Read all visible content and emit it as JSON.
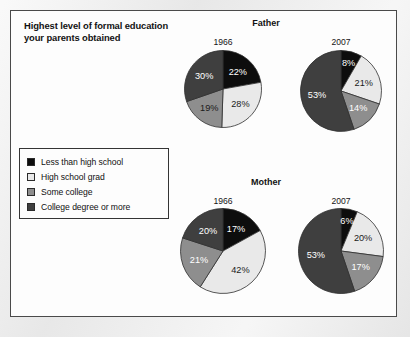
{
  "panel": {
    "title": "Highest level of formal education your parents obtained"
  },
  "groups": {
    "father": "Father",
    "mother": "Mother"
  },
  "legend": {
    "items": [
      {
        "label": "Less than high school",
        "color": "#0d0d0d"
      },
      {
        "label": "High school grad",
        "color": "#e9e9e9"
      },
      {
        "label": "Some college",
        "color": "#8e8e8e"
      },
      {
        "label": "College degree or more",
        "color": "#3f3f3f"
      }
    ]
  },
  "chart_data": {
    "type": "pie",
    "title": "Highest level of formal education your parents obtained",
    "categories": [
      "Less than high school",
      "High school grad",
      "Some college",
      "College degree or more"
    ],
    "colors": [
      "#0d0d0d",
      "#e9e9e9",
      "#8e8e8e",
      "#3f3f3f"
    ],
    "legend_position": "left",
    "units": "percent",
    "charts": [
      {
        "group": "Father",
        "year": "1966",
        "values": [
          22,
          28,
          19,
          30
        ],
        "labels": [
          "22%",
          "28%",
          "19%",
          "30%"
        ],
        "label_on_dark": [
          true,
          false,
          false,
          true
        ]
      },
      {
        "group": "Father",
        "year": "2007",
        "values": [
          8,
          21,
          14,
          53
        ],
        "labels": [
          "8%",
          "21%",
          "14%",
          "53%"
        ],
        "label_on_dark": [
          true,
          false,
          true,
          true
        ]
      },
      {
        "group": "Mother",
        "year": "1966",
        "values": [
          17,
          42,
          21,
          20
        ],
        "labels": [
          "17%",
          "42%",
          "21%",
          "20%"
        ],
        "label_on_dark": [
          true,
          false,
          true,
          true
        ]
      },
      {
        "group": "Mother",
        "year": "2007",
        "values": [
          6,
          20,
          17,
          53
        ],
        "labels": [
          "6%",
          "20%",
          "17%",
          "53%"
        ],
        "label_on_dark": [
          true,
          false,
          true,
          true
        ]
      }
    ]
  }
}
